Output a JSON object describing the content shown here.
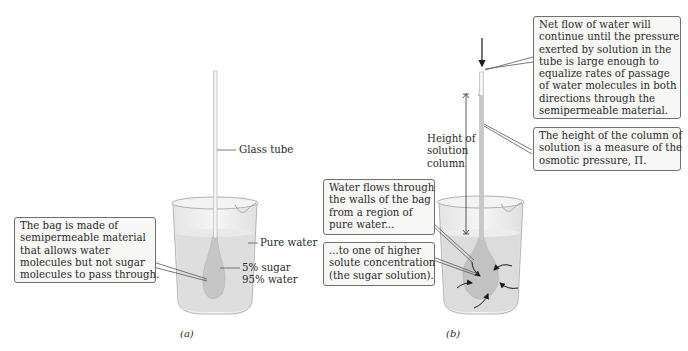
{
  "figure": {
    "panel_a": {
      "caption": "(a)",
      "labels": {
        "glass_tube": "Glass tube",
        "pure_water": "Pure water",
        "sugar_line1": "5% sugar",
        "sugar_line2": "95% water"
      },
      "callout_bag": {
        "lines": [
          "The bag is made of",
          "semipermeable material",
          "that allows water",
          "molecules but not sugar",
          "molecules to pass through."
        ]
      }
    },
    "panel_b": {
      "caption": "(b)",
      "labels": {
        "height_line1": "Height of",
        "height_line2": "solution",
        "height_line3": "column"
      },
      "callout_net_flow": {
        "lines": [
          "Net flow of water will",
          "continue until the pressure",
          "exerted by solution in the",
          "tube is large enough to",
          "equalize rates of passage",
          "of water molecules in both",
          "directions through the",
          "semipermeable material."
        ]
      },
      "callout_height": {
        "lines": [
          "The height of the column of",
          "solution is a measure of the",
          "osmotic pressure, Π."
        ]
      },
      "callout_water_flows": {
        "lines": [
          "Water flows through",
          "the walls of the bag",
          "from a region of",
          "pure water..."
        ]
      },
      "callout_higher_conc": {
        "lines": [
          "...to one of higher",
          "solute concentration",
          "(the sugar solution)."
        ]
      }
    },
    "colors": {
      "water": "#dcdcdc",
      "bag": "#c4c4c4",
      "glass": "#efefef",
      "outline": "#8a8a8a",
      "callout_bg": "#f7f7f5",
      "callout_border": "#6f6f6f",
      "arrow": "#1a1a1a"
    }
  }
}
